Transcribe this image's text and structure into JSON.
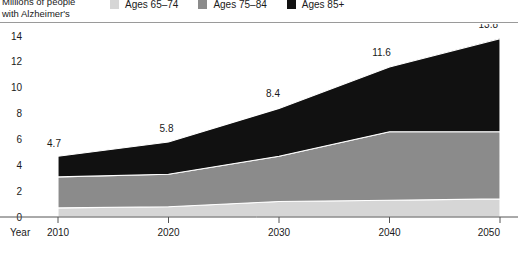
{
  "axis_title": {
    "line1": "Millions of people",
    "line2": "with Alzheimer's"
  },
  "year_axis_label": "Year",
  "legend": {
    "items": [
      {
        "label": "Ages 65–74",
        "color": "#d6d6d6"
      },
      {
        "label": "Ages 75–84",
        "color": "#8b8b8b"
      },
      {
        "label": "Ages 85+",
        "color": "#111111"
      }
    ]
  },
  "chart_data": {
    "type": "area",
    "stacked": true,
    "title": "Millions of people with Alzheimer's",
    "xlabel": "Year",
    "ylabel": "Millions of people with Alzheimer's",
    "x": [
      2010,
      2020,
      2030,
      2040,
      2050
    ],
    "categories": [
      "2010",
      "2020",
      "2030",
      "2040",
      "2050"
    ],
    "xticks": [
      "2010",
      "2020",
      "2030",
      "2040",
      "2050"
    ],
    "yticks": [
      "0",
      "2",
      "4",
      "6",
      "8",
      "10",
      "12",
      "14"
    ],
    "ylim": [
      0,
      14
    ],
    "xlim": [
      2010,
      2050
    ],
    "grid": false,
    "legend_position": "top",
    "series": [
      {
        "name": "Ages 65–74",
        "color": "#d6d6d6",
        "values": [
          0.7,
          0.8,
          1.2,
          1.3,
          1.4
        ]
      },
      {
        "name": "Ages 75–84",
        "color": "#8b8b8b",
        "values": [
          2.4,
          2.5,
          3.5,
          5.3,
          5.2
        ]
      },
      {
        "name": "Ages 85+",
        "color": "#111111",
        "values": [
          1.6,
          2.5,
          3.7,
          5.0,
          7.2
        ]
      }
    ],
    "totals": [
      4.7,
      5.8,
      8.4,
      11.6,
      13.8
    ],
    "data_labels": [
      "4.7",
      "5.8",
      "8.4",
      "11.6",
      "13.8"
    ],
    "annotations": [
      {
        "x": 2010,
        "value": 4.7,
        "text": "4.7"
      },
      {
        "x": 2020,
        "value": 5.8,
        "text": "5.8"
      },
      {
        "x": 2030,
        "value": 8.4,
        "text": "8.4"
      },
      {
        "x": 2040,
        "value": 11.6,
        "text": "11.6"
      },
      {
        "x": 2050,
        "value": 13.8,
        "text": "13.8"
      }
    ]
  }
}
